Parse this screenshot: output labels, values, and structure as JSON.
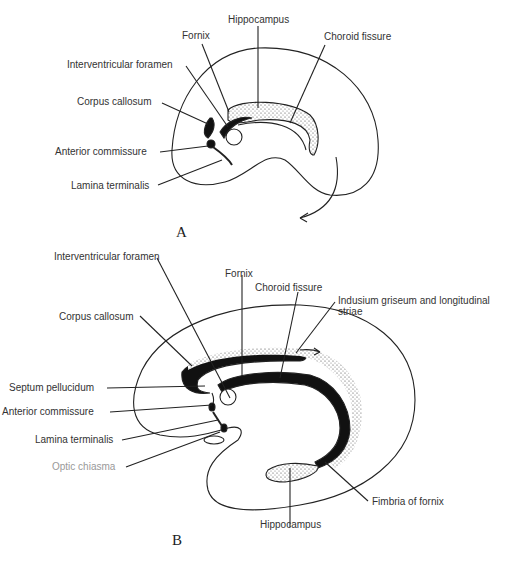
{
  "figure": {
    "panel_a": {
      "letter": "A",
      "labels": {
        "hippocampus": "Hippocampus",
        "fornix": "Fornix",
        "choroid_fissure": "Choroid fissure",
        "interventricular_foramen": "Interventricular foramen",
        "corpus_callosum": "Corpus callosum",
        "anterior_commissure": "Anterior commissure",
        "lamina_terminalis": "Lamina terminalis"
      }
    },
    "panel_b": {
      "letter": "B",
      "labels": {
        "interventricular_foramen": "Interventricular foramen",
        "fornix": "Fornix",
        "choroid_fissure": "Choroid fissure",
        "indusium_line1": "Indusium griseum and longitudinal",
        "indusium_line2": "striae",
        "corpus_callosum": "Corpus callosum",
        "septum_pellucidum": "Septum pellucidum",
        "anterior_commissure": "Anterior commissure",
        "lamina_terminalis": "Lamina terminalis",
        "optic_chiasma": "Optic chiasma",
        "fimbria_of_fornix": "Fimbria of fornix",
        "hippocampus": "Hippocampus"
      }
    }
  }
}
